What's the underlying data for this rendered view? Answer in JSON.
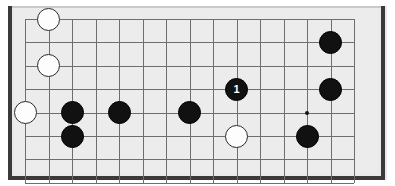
{
  "diagram": {
    "board": {
      "type": "go-board-fragment",
      "columns": 15,
      "rows": 8,
      "grid_origin_x": 25,
      "grid_origin_y": 19,
      "grid_spacing_x": 23.5,
      "grid_spacing_y": 23.4,
      "background_color": "#ececec",
      "line_color": "#6e6e6e",
      "edge_color": "#3a3a3a"
    },
    "star_points": [
      {
        "name": "hoshi-c13r5",
        "col": 12,
        "row": 4
      }
    ],
    "stones": [
      {
        "name": "white-stone-c2r1",
        "color": "white",
        "col": 1,
        "row": 0,
        "label": ""
      },
      {
        "name": "white-stone-c2r3",
        "color": "white",
        "col": 1,
        "row": 2,
        "label": ""
      },
      {
        "name": "white-stone-c1r5",
        "color": "white",
        "col": 0,
        "row": 4,
        "label": ""
      },
      {
        "name": "black-stone-c3r5",
        "color": "black",
        "col": 2,
        "row": 4,
        "label": ""
      },
      {
        "name": "black-stone-c3r6",
        "color": "black",
        "col": 2,
        "row": 5,
        "label": ""
      },
      {
        "name": "black-stone-c5r5",
        "color": "black",
        "col": 4,
        "row": 4,
        "label": ""
      },
      {
        "name": "black-stone-c8r5",
        "color": "black",
        "col": 7,
        "row": 4,
        "label": ""
      },
      {
        "name": "black-stone-move-1",
        "color": "black",
        "col": 9,
        "row": 3,
        "label": "1"
      },
      {
        "name": "white-stone-c10r6",
        "color": "white",
        "col": 9,
        "row": 5,
        "label": ""
      },
      {
        "name": "black-stone-c14r2",
        "color": "black",
        "col": 13,
        "row": 1,
        "label": ""
      },
      {
        "name": "black-stone-c14r4",
        "color": "black",
        "col": 13,
        "row": 3,
        "label": ""
      },
      {
        "name": "black-stone-c13r6",
        "color": "black",
        "col": 12,
        "row": 5,
        "label": ""
      }
    ],
    "move_labels": [
      "1"
    ],
    "stone_radius": 11.5,
    "colors": {
      "black_stone": "#111111",
      "white_stone": "#fdfdfd",
      "white_stone_border": "#2a2a2a",
      "label_on_black": "#ffffff"
    }
  }
}
